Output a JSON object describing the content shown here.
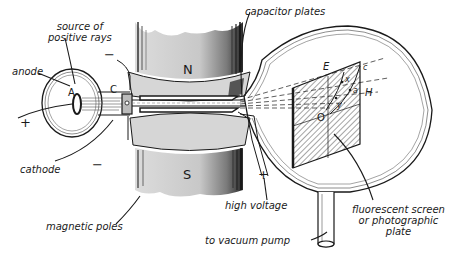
{
  "diagram": {
    "colors": {
      "ink": "#1a1a1a",
      "pole_gray": "#cfcfcf",
      "pole_dark": "#6a6a6a",
      "background": "#ffffff"
    },
    "labels": {
      "source": "source of\npositive rays",
      "source_line1": "source of",
      "source_line2": "positive rays",
      "anode": "anode",
      "cathode": "cathode",
      "magnetic_poles": "magnetic poles",
      "capacitor_plates": "capacitor plates",
      "high_voltage": "high voltage",
      "vacuum_pump": "to vacuum pump",
      "screen_line1": "fluorescent screen",
      "screen_line2": "or photographic",
      "screen_line3": "plate"
    },
    "symbols": {
      "anode_letter": "A",
      "cathode_letter": "C",
      "north_pole": "N",
      "south_pole": "S",
      "plus_left": "+",
      "minus_top": "−",
      "minus_bottom": "−",
      "plus_hv": "+",
      "screen_E": "E",
      "screen_H": "H",
      "screen_O": "O",
      "curve_c": "c",
      "curve_x": "x",
      "curve_a": "a",
      "curve_y": "y"
    }
  }
}
